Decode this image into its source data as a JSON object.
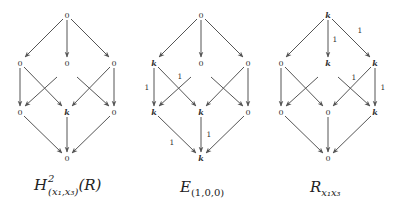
{
  "layout": {
    "diagram_centers_x": [
      67,
      201,
      328
    ],
    "layer_y": [
      15,
      63,
      112,
      158
    ],
    "spread_x": 47
  },
  "diagrams": [
    {
      "id": "local-cohomology",
      "caption": {
        "base": "H",
        "sup": "2",
        "sub": "(x₁,x₃)",
        "tail": "(R)"
      },
      "nodes": {
        "top": "0",
        "l1": [
          "0",
          "0",
          "0"
        ],
        "l2": [
          "0",
          "k",
          "0"
        ],
        "bottom": "0"
      },
      "edge_labels": []
    },
    {
      "id": "E-100",
      "caption": {
        "base": "E",
        "sub": "(1,0,0)"
      },
      "nodes": {
        "top": "0",
        "l1": [
          "k",
          "0",
          "0"
        ],
        "l2": [
          "k",
          "k",
          "0"
        ],
        "bottom": "k"
      },
      "edge_labels": [
        {
          "edge": "l1_0-l2_0",
          "text": "1"
        },
        {
          "edge": "l1_1-l2_0",
          "text": "1"
        },
        {
          "edge": "l2_0-bottom",
          "text": "1"
        },
        {
          "edge": "l2_1-bottom",
          "text": "1"
        }
      ]
    },
    {
      "id": "R-x1x3",
      "caption": {
        "base": "R",
        "sub": "x₁x₃"
      },
      "nodes": {
        "top": "k",
        "l1": [
          "0",
          "k",
          "k"
        ],
        "l2": [
          "0",
          "0",
          "k"
        ],
        "bottom": "0"
      },
      "edge_labels": [
        {
          "edge": "top-l1_1",
          "text": "1"
        },
        {
          "edge": "top-l1_2",
          "text": "1"
        },
        {
          "edge": "l1_1-l2_2",
          "text": "1"
        },
        {
          "edge": "l1_2-l2_2",
          "text": "1"
        }
      ]
    }
  ],
  "text": {
    "d0": {
      "top": "0",
      "l1_0": "0",
      "l1_1": "0",
      "l1_2": "0",
      "l2_0": "0",
      "l2_1": "k",
      "l2_2": "0",
      "bottom": "0",
      "cap_base": "H",
      "cap_sup": "2",
      "cap_sub": "(x₁,x₃)",
      "cap_tail": "(R)"
    },
    "d1": {
      "top": "0",
      "l1_0": "k",
      "l1_1": "0",
      "l1_2": "0",
      "l2_0": "k",
      "l2_1": "k",
      "l2_2": "0",
      "bottom": "k",
      "cap_base": "E",
      "cap_sub": "(1,0,0)",
      "lab_a": "1",
      "lab_b": "1",
      "lab_c": "1",
      "lab_d": "1"
    },
    "d2": {
      "top": "k",
      "l1_0": "0",
      "l1_1": "k",
      "l1_2": "k",
      "l2_0": "0",
      "l2_1": "0",
      "l2_2": "k",
      "bottom": "0",
      "cap_base": "R",
      "cap_sub": "x₁x₃",
      "lab_a": "1",
      "lab_b": "1",
      "lab_c": "1",
      "lab_d": "1"
    }
  }
}
